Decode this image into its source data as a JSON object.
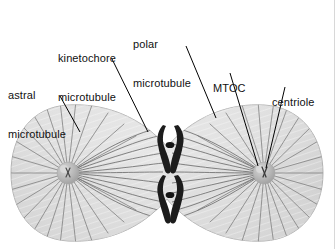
{
  "figure": {
    "background_color": "#ffffff",
    "border_color": "#d8d8d8",
    "cell": {
      "fill_color": "#d9d9d9",
      "outline_color": "#b0b0b0",
      "shade_color": "#c4c4c4"
    },
    "mtoc": {
      "fill_color": "#b6b6b6",
      "highlight_color": "#cfcfcf",
      "left_center": [
        68,
        173
      ],
      "right_center": [
        264,
        173
      ]
    },
    "chromosome": {
      "color": "#1c1c1c",
      "count": 2,
      "positions": [
        [
          170,
          150
        ],
        [
          170,
          200
        ]
      ]
    },
    "fiber": {
      "color": "#6e6e6e",
      "astral_color": "#7a7a7a"
    },
    "leader_color": "#000000"
  },
  "labels": [
    {
      "id": "astral-microtubule",
      "lines": [
        "astral",
        "microtubule"
      ],
      "x": 8,
      "y": 70,
      "leader": [
        [
          60,
          96
        ],
        [
          80,
          132
        ]
      ]
    },
    {
      "id": "kinetochore-microtubule",
      "lines": [
        "kinetochore",
        "microtubule"
      ],
      "x": 58,
      "y": 28,
      "leader": [
        [
          112,
          59
        ],
        [
          148,
          132
        ]
      ]
    },
    {
      "id": "polar-microtubule",
      "lines": [
        "polar",
        "microtubule"
      ],
      "x": 133,
      "y": 14,
      "leader": [
        [
          186,
          46
        ],
        [
          216,
          118
        ]
      ]
    },
    {
      "id": "mtoc",
      "lines": [
        "MTOC"
      ],
      "x": 213,
      "y": 58,
      "leader": [
        [
          230,
          73
        ],
        [
          258,
          166
        ]
      ]
    },
    {
      "id": "centriole",
      "lines": [
        "centriole"
      ],
      "x": 272,
      "y": 72,
      "leader": [
        [
          285,
          87
        ],
        [
          266,
          168
        ]
      ]
    }
  ]
}
